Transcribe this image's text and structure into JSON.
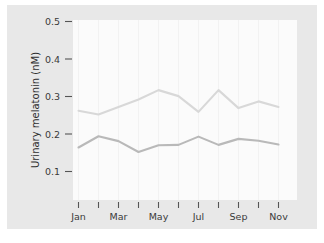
{
  "figure": {
    "panel_background": "#e8e8e8",
    "plot_background": "#fbfbfb",
    "page_background": "#ffffff"
  },
  "chart_data": {
    "type": "line",
    "title": "",
    "xlabel": "",
    "ylabel": "Urinary melatonin (nM)",
    "x": [
      "Jan",
      "Feb",
      "Mar",
      "Apr",
      "May",
      "Jun",
      "Jul",
      "Aug",
      "Sep",
      "Oct",
      "Nov"
    ],
    "xticklabels": [
      "Jan",
      "",
      "Mar",
      "",
      "May",
      "",
      "Jul",
      "",
      "Sep",
      "",
      "Nov"
    ],
    "xtick_major_labels": [
      "Jan",
      "Mar",
      "May",
      "Jul",
      "Sep",
      "Nov"
    ],
    "yticks": [
      0.1,
      0.2,
      0.3,
      0.4,
      0.5
    ],
    "yticklabels": [
      "0.1",
      "0.2",
      "0.3",
      "0.4",
      "0.5"
    ],
    "ylim": [
      0.045,
      0.52
    ],
    "grid": "vertical-faint",
    "legend": "none",
    "series": [
      {
        "name": "upper",
        "color": "#d8d8d8",
        "values": [
          0.262,
          0.252,
          0.272,
          0.292,
          0.317,
          0.301,
          0.259,
          0.317,
          0.269,
          0.287,
          0.272
        ]
      },
      {
        "name": "lower",
        "color": "#b9b9b9",
        "values": [
          0.164,
          0.194,
          0.181,
          0.152,
          0.17,
          0.171,
          0.193,
          0.171,
          0.187,
          0.182,
          0.172
        ]
      }
    ]
  },
  "axis": {
    "ytick_0": "0.1",
    "ytick_1": "0.2",
    "ytick_2": "0.3",
    "ytick_3": "0.4",
    "ytick_4": "0.5",
    "xtick_0": "Jan",
    "xtick_1": "Mar",
    "xtick_2": "May",
    "xtick_3": "Jul",
    "xtick_4": "Sep",
    "xtick_5": "Nov",
    "ylabel": "Urinary melatonin (nM)"
  }
}
